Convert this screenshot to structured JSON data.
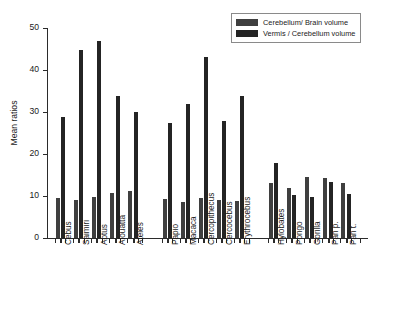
{
  "chart_data": {
    "type": "bar",
    "title": "",
    "xlabel": "",
    "ylabel": "Mean ratios",
    "ylim": [
      0,
      50
    ],
    "yticks": [
      0,
      10,
      20,
      30,
      40,
      50
    ],
    "ytick_labels": [
      "0",
      "10",
      "20",
      "30",
      "40",
      "50"
    ],
    "grid": false,
    "legend_position": "top-right",
    "categories": [
      "Cebus",
      "Saimiri",
      "Aotus",
      "Alouatta",
      "Ateles",
      "Papio",
      "Macaca",
      "Cercopithecus",
      "Cercocebus",
      "Erythrocebus",
      "Hylobates",
      "Pongo",
      "Gorilla",
      "Pan p.",
      "Pan t."
    ],
    "groups": [
      {
        "name": "New World monkeys",
        "categories": [
          "Cebus",
          "Saimiri",
          "Aotus",
          "Alouatta",
          "Ateles"
        ]
      },
      {
        "name": "Old World monkeys",
        "categories": [
          "Papio",
          "Macaca",
          "Cercopithecus",
          "Cercocebus",
          "Erythrocebus"
        ]
      },
      {
        "name": "Apes",
        "categories": [
          "Hylobates",
          "Pongo",
          "Gorilla",
          "Pan p.",
          "Pan t."
        ]
      }
    ],
    "series": [
      {
        "name": "Cerebellum/ Brain volume",
        "color": "#3f3f3f",
        "values": [
          9.5,
          9.0,
          9.7,
          10.8,
          11.2,
          9.4,
          8.5,
          9.5,
          9.0,
          8.7,
          13.1,
          12.0,
          14.6,
          14.3,
          13.1
        ]
      },
      {
        "name": "Vermis / Cerebellum volume",
        "color": "#242424",
        "values": [
          28.7,
          44.8,
          47.0,
          33.9,
          29.9,
          27.4,
          31.9,
          43.2,
          27.8,
          33.9,
          17.8,
          10.2,
          9.8,
          13.4,
          10.4
        ]
      }
    ]
  },
  "legend": {
    "entries": [
      {
        "label": "Cerebellum/ Brain volume",
        "color": "#3f3f3f"
      },
      {
        "label": "Vermis / Cerebellum volume",
        "color": "#242424"
      }
    ]
  }
}
